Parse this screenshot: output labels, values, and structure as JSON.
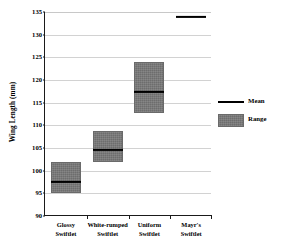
{
  "chart_data": {
    "type": "bar",
    "title": "",
    "xlabel": "",
    "ylabel": "Wing Length (mm)",
    "ylim": [
      90,
      135
    ],
    "ytick_step": 5,
    "yticks": [
      90,
      95,
      100,
      105,
      110,
      115,
      120,
      125,
      130,
      135
    ],
    "grid": true,
    "legend_position": "right",
    "categories": [
      "Glossy\nSwiftlet",
      "White-rumped\nSwiftlet",
      "Uniform\nSwiftlet",
      "Mayr's\nSwiftlet"
    ],
    "series": [
      {
        "name": "Range",
        "type": "range-box",
        "values": [
          {
            "low": 95.0,
            "high": 102.0
          },
          {
            "low": 102.0,
            "high": 108.7
          },
          {
            "low": 112.8,
            "high": 124.0
          },
          null
        ]
      },
      {
        "name": "Mean",
        "type": "mean-line",
        "values": [
          97.5,
          104.5,
          117.3,
          134.0
        ]
      }
    ],
    "legend": [
      {
        "label": "Mean",
        "marker": "line",
        "color": "#000000"
      },
      {
        "label": "Range",
        "marker": "box",
        "color": "#787878"
      }
    ],
    "colors": {
      "range_fill": "#787878",
      "mean_line": "#000000",
      "gridline": "#d2d2d2",
      "axis": "#1a1a1a",
      "background": "#ffffff"
    }
  },
  "axis": {
    "y_title": "Wing Length (mm)",
    "tick_labels": [
      "135",
      "130",
      "125",
      "120",
      "115",
      "110",
      "105",
      "100",
      "95",
      "90"
    ]
  },
  "categories": [
    {
      "line1": "Glossy",
      "line2": "Swiftlet"
    },
    {
      "line1": "White-rumped",
      "line2": "Swiftlet"
    },
    {
      "line1": "Uniform",
      "line2": "Swiftlet"
    },
    {
      "line1": "Mayr's",
      "line2": "Swiftlet"
    }
  ],
  "legend": {
    "mean_label": "Mean",
    "range_label": "Range"
  }
}
